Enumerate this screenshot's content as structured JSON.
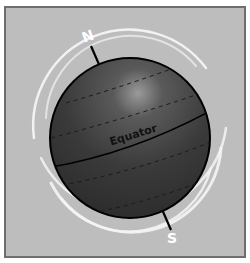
{
  "diagram": {
    "labels": {
      "north": "N",
      "south": "S",
      "equator": "Equator"
    },
    "colors": {
      "background": "#bdbdbd",
      "border": "#6e6e6e",
      "sphere_dark": "#2e2e2e",
      "sphere_light": "#8a8a8a",
      "orbit_rings": "#f2f2f2",
      "axis": "#000000",
      "pole_labels": "#ffffff"
    }
  }
}
